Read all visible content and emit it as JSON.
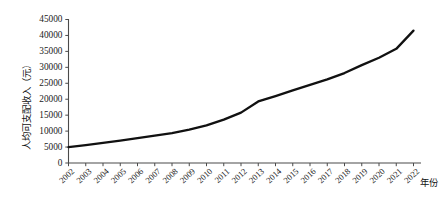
{
  "chart_data": {
    "type": "line",
    "title": "",
    "subtitle": "",
    "xlabel": "年份",
    "ylabel": "人均可支配收入（元）",
    "x": [
      2002,
      2003,
      2004,
      2005,
      2006,
      2007,
      2008,
      2009,
      2010,
      2011,
      2012,
      2013,
      2014,
      2015,
      2016,
      2017,
      2018,
      2019,
      2020,
      2021,
      2022
    ],
    "categories": [
      "2002",
      "2003",
      "2004",
      "2005",
      "2006",
      "2007",
      "2008",
      "2009",
      "2010",
      "2011",
      "2012",
      "2013",
      "2014",
      "2015",
      "2016",
      "2017",
      "2018",
      "2019",
      "2020",
      "2021",
      "2022"
    ],
    "series": [
      {
        "name": "人均可支配收入",
        "values": [
          5000,
          5600,
          6300,
          7000,
          7800,
          8600,
          9400,
          10500,
          11800,
          13600,
          15800,
          19300,
          21000,
          22800,
          24500,
          26200,
          28200,
          30700,
          33000,
          35800,
          41500
        ]
      }
    ],
    "values": [
      5000,
      5600,
      6300,
      7000,
      7800,
      8600,
      9400,
      10500,
      11800,
      13600,
      15800,
      19300,
      21000,
      22800,
      24500,
      26200,
      28200,
      30700,
      33000,
      35800,
      41500
    ],
    "ylim": [
      0,
      45000
    ],
    "ytick_labels": [
      "0",
      "5000",
      "10000",
      "15000",
      "20000",
      "25000",
      "30000",
      "35000",
      "40000",
      "45000"
    ],
    "ytick_values": [
      0,
      5000,
      10000,
      15000,
      20000,
      25000,
      30000,
      35000,
      40000,
      45000
    ],
    "grid": false,
    "legend": false,
    "legend_position": "none",
    "line_color": "#111111",
    "axis_color": "#4a4a4a",
    "background_color": "#ffffff"
  }
}
